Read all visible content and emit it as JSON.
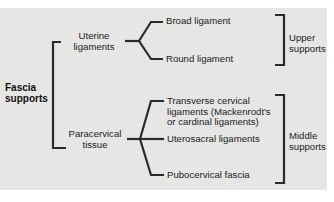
{
  "diagram": {
    "root": {
      "line1": "Fascia",
      "line2": "supports"
    },
    "groups": [
      {
        "name": {
          "line1": "Uterine",
          "line2": "ligaments"
        },
        "children": [
          "Broad ligament",
          "Round ligament"
        ],
        "category": {
          "line1": "Upper",
          "line2": "supports"
        }
      },
      {
        "name": {
          "line1": "Paracervical",
          "line2": "tissue"
        },
        "children": [
          {
            "line1": "Transverse cervical",
            "line2": "ligaments (Mackenrodt's",
            "line3": "or cardinal ligaments)"
          },
          "Uterosacral ligaments",
          "Pubocervical fascia"
        ],
        "category": {
          "line1": "Middle",
          "line2": "supports"
        }
      }
    ],
    "colors": {
      "background": "#e6e6e4",
      "line": "#2a2a2a",
      "text": "#222222"
    }
  }
}
